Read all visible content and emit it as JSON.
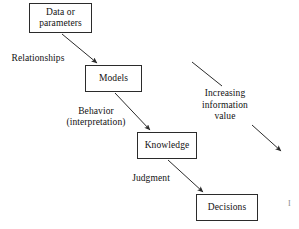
{
  "diagram": {
    "background_color": "#ffffff",
    "stroke_color": "#2b2b2b",
    "text_color": "#111111",
    "nodes": [
      {
        "id": "data",
        "label": "Data or\nparameters",
        "x": 29,
        "y": 3,
        "w": 63,
        "h": 30
      },
      {
        "id": "models",
        "label": "Models",
        "x": 85,
        "y": 65,
        "w": 57,
        "h": 27
      },
      {
        "id": "knowledge",
        "label": "Knowledge",
        "x": 137,
        "y": 132,
        "w": 60,
        "h": 27
      },
      {
        "id": "decisions",
        "label": "Decisions",
        "x": 196,
        "y": 194,
        "w": 62,
        "h": 27
      }
    ],
    "edges": [
      {
        "id": "data-to-models",
        "from": "data",
        "to": "models",
        "label": "Relationships",
        "arrowhead": true
      },
      {
        "id": "models-to-knowledge",
        "from": "models",
        "to": "knowledge",
        "label": "Behavior\n(interpretation)",
        "arrowhead": true
      },
      {
        "id": "knowledge-to-decisions",
        "from": "knowledge",
        "to": "decisions",
        "label": "Judgment",
        "arrowhead": true
      }
    ],
    "edge_labels": [
      {
        "id": "relationships",
        "text": "Relationships",
        "x": 2,
        "y": 53,
        "w": 72
      },
      {
        "id": "behavior",
        "text": "Behavior\n(interpretation)",
        "x": 54,
        "y": 106,
        "w": 84
      },
      {
        "id": "judgment",
        "text": "Judgment",
        "x": 122,
        "y": 173,
        "w": 58
      }
    ],
    "annotation": {
      "id": "increasing-information-value",
      "text": "Increasing\ninformation\nvalue",
      "x": 196,
      "y": 88,
      "w": 58,
      "upper_stroke": {
        "x1": 192,
        "y1": 62,
        "x2": 222,
        "y2": 86,
        "arrowhead": false
      },
      "lower_stroke": {
        "x1": 252,
        "y1": 125,
        "x2": 281,
        "y2": 151,
        "arrowhead": true
      }
    },
    "margin_marks": [
      {
        "id": "page-margin-glyph",
        "text": "I",
        "x": 288,
        "y": 200
      }
    ]
  }
}
